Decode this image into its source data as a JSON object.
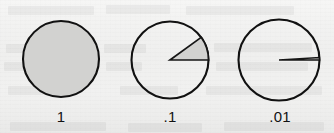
{
  "figure": {
    "kind": "proportional-area-pie-series",
    "background_color": "#f4f4f3",
    "stroke_color": "#111111",
    "fill_color": "#d2d2d0",
    "caption_font_size_px": 15
  },
  "chart_data": {
    "type": "pie",
    "title": "",
    "subtitle": "",
    "xlabel": "",
    "ylabel": "",
    "legend_position": "none",
    "grid": false,
    "note": "Three separate pie/disc glyphs, each showing a shaded sector whose area equals the labeled fraction of the whole circle. Sectors start at 0 degrees (due east) and sweep counterclockwise.",
    "panels": [
      {
        "id": "pie-1",
        "label": "1",
        "value": 1,
        "percent": 100,
        "sweep_degrees": 360,
        "start_angle_degrees": 0,
        "direction": "counterclockwise",
        "center_x": 61,
        "center_y": 59,
        "radius": 38,
        "fill": "#d2d2d0",
        "stroke": "#111111",
        "label_x": 61,
        "label_y": 109
      },
      {
        "id": "pie-point-1",
        "label": ".1",
        "value": 0.1,
        "percent": 10,
        "sweep_degrees": 36,
        "start_angle_degrees": 0,
        "direction": "counterclockwise",
        "center_x": 170,
        "center_y": 60,
        "radius": 38.5,
        "fill": "#d2d2d0",
        "stroke": "#111111",
        "label_x": 170,
        "label_y": 109
      },
      {
        "id": "pie-point-01",
        "label": ".01",
        "value": 0.01,
        "percent": 1,
        "sweep_degrees": 3.6,
        "start_angle_degrees": 0,
        "direction": "counterclockwise",
        "center_x": 279,
        "center_y": 60,
        "radius": 40.5,
        "fill": "#d2d2d0",
        "stroke": "#111111",
        "label_x": 280,
        "label_y": 109
      }
    ],
    "categories": [
      "1",
      ".1",
      ".01"
    ],
    "values": [
      1,
      0.1,
      0.01
    ]
  },
  "captions": {
    "pie_1": "1",
    "pie_2": ".1",
    "pie_3": ".01"
  }
}
